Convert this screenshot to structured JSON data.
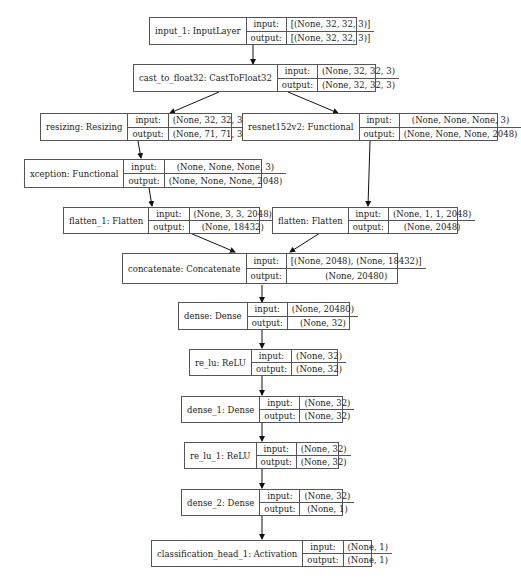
{
  "diagram": {
    "type": "keras-model-plot",
    "labels": {
      "input": "input:",
      "output": "output:"
    },
    "nodes": [
      {
        "id": "input_1",
        "name": "input_1: InputLayer",
        "input": "[(None, 32, 32, 3)]",
        "output": "[(None, 32, 32, 3)]"
      },
      {
        "id": "cast_to_float32",
        "name": "cast_to_float32: CastToFloat32",
        "input": "(None, 32, 32, 3)",
        "output": "(None, 32, 32, 3)"
      },
      {
        "id": "resizing",
        "name": "resizing: Resizing",
        "input": "(None, 32, 32, 3)",
        "output": "(None, 71, 71, 3)"
      },
      {
        "id": "resnet152v2",
        "name": "resnet152v2: Functional",
        "input": "(None, None, None, 3)",
        "output": "(None, None, None, 2048)"
      },
      {
        "id": "xception",
        "name": "xception: Functional",
        "input": "(None, None, None, 3)",
        "output": "(None, None, None, 2048)"
      },
      {
        "id": "flatten_1",
        "name": "flatten_1: Flatten",
        "input": "(None, 3, 3, 2048)",
        "output": "(None, 18432)"
      },
      {
        "id": "flatten",
        "name": "flatten: Flatten",
        "input": "(None, 1, 1, 2048)",
        "output": "(None, 2048)"
      },
      {
        "id": "concatenate",
        "name": "concatenate: Concatenate",
        "input": "[(None, 2048), (None, 18432)]",
        "output": "(None, 20480)"
      },
      {
        "id": "dense",
        "name": "dense: Dense",
        "input": "(None, 20480)",
        "output": "(None, 32)"
      },
      {
        "id": "re_lu",
        "name": "re_lu: ReLU",
        "input": "(None, 32)",
        "output": "(None, 32)"
      },
      {
        "id": "dense_1",
        "name": "dense_1: Dense",
        "input": "(None, 32)",
        "output": "(None, 32)"
      },
      {
        "id": "re_lu_1",
        "name": "re_lu_1: ReLU",
        "input": "(None, 32)",
        "output": "(None, 32)"
      },
      {
        "id": "dense_2",
        "name": "dense_2: Dense",
        "input": "(None, 32)",
        "output": "(None, 1)"
      },
      {
        "id": "classification_head_1",
        "name": "classification_head_1: Activation",
        "input": "(None, 1)",
        "output": "(None, 1)"
      }
    ],
    "edges": [
      [
        "input_1",
        "cast_to_float32"
      ],
      [
        "cast_to_float32",
        "resizing"
      ],
      [
        "cast_to_float32",
        "resnet152v2"
      ],
      [
        "resizing",
        "xception"
      ],
      [
        "xception",
        "flatten_1"
      ],
      [
        "resnet152v2",
        "flatten"
      ],
      [
        "flatten",
        "concatenate"
      ],
      [
        "flatten_1",
        "concatenate"
      ],
      [
        "concatenate",
        "dense"
      ],
      [
        "dense",
        "re_lu"
      ],
      [
        "re_lu",
        "dense_1"
      ],
      [
        "dense_1",
        "re_lu_1"
      ],
      [
        "re_lu_1",
        "dense_2"
      ],
      [
        "dense_2",
        "classification_head_1"
      ]
    ]
  }
}
